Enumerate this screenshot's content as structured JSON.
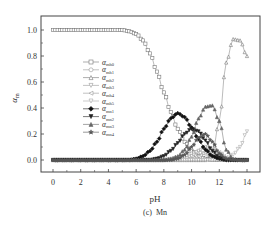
{
  "chart_data": {
    "type": "line",
    "title": "",
    "caption": "(c)  Mn",
    "xlabel": "pH",
    "ylabel": "α_m",
    "ylabel_main": "α",
    "ylabel_sub": "m",
    "xlim": [
      -1,
      15
    ],
    "ylim": [
      -0.1,
      1.15
    ],
    "xticks": [
      0,
      2,
      4,
      6,
      8,
      10,
      12,
      14
    ],
    "yticks": [
      0.0,
      0.2,
      0.4,
      0.6,
      0.8,
      1.0
    ],
    "xtick_labels": [
      "0",
      "2",
      "4",
      "6",
      "8",
      "10",
      "12",
      "14"
    ],
    "ytick_labels": [
      "0.0",
      "0.2",
      "0.4",
      "0.6",
      "0.8",
      "1.0"
    ],
    "grid": false,
    "legend_position": "inside-left-center",
    "legend": [
      {
        "name": "α_mh0",
        "main": "α",
        "sub": "mh0",
        "marker": "square-open",
        "color": "#777777"
      },
      {
        "name": "α_mh1",
        "main": "α",
        "sub": "mh1",
        "marker": "circle-open",
        "color": "#999999"
      },
      {
        "name": "α_mh2",
        "main": "α",
        "sub": "mh2",
        "marker": "triangle-up-open",
        "color": "#777777"
      },
      {
        "name": "α_mh3",
        "main": "α",
        "sub": "mh3",
        "marker": "triangle-down-open",
        "color": "#999999"
      },
      {
        "name": "α_mh4",
        "main": "α",
        "sub": "mh4",
        "marker": "triangle-left-open",
        "color": "#999999"
      },
      {
        "name": "α_mh5",
        "main": "α",
        "sub": "mh5",
        "marker": "triangle-down-open",
        "color": "#aaaaaa"
      },
      {
        "name": "α_mn1",
        "main": "α",
        "sub": "mn1",
        "marker": "diamond-filled",
        "color": "#111111"
      },
      {
        "name": "α_mn2",
        "main": "α",
        "sub": "mn2",
        "marker": "triangle-down-filled",
        "color": "#222222"
      },
      {
        "name": "α_mn3",
        "main": "α",
        "sub": "mn3",
        "marker": "triangle-up-filled",
        "color": "#666666"
      },
      {
        "name": "α_mn4",
        "main": "α",
        "sub": "mn4",
        "marker": "star-filled",
        "color": "#555555"
      }
    ],
    "x": [
      0,
      0.5,
      1,
      1.5,
      2,
      2.5,
      3,
      3.5,
      4,
      4.5,
      5,
      5.5,
      6,
      6.5,
      7,
      7.5,
      8,
      8.5,
      9,
      9.5,
      10,
      10.5,
      11,
      11.5,
      12,
      12.5,
      13,
      13.5,
      14
    ],
    "series": [
      {
        "name": "α_mh0",
        "values": [
          1,
          1,
          1,
          1,
          1,
          1,
          1,
          1,
          1,
          1,
          1,
          0.99,
          0.97,
          0.92,
          0.82,
          0.68,
          0.52,
          0.37,
          0.24,
          0.14,
          0.07,
          0.03,
          0.01,
          0,
          0,
          0,
          0,
          0,
          0
        ]
      },
      {
        "name": "α_mh1",
        "values": [
          0,
          0,
          0,
          0,
          0,
          0,
          0,
          0,
          0,
          0,
          0,
          0,
          0,
          0,
          0,
          0,
          0,
          0.01,
          0.02,
          0.03,
          0.05,
          0.06,
          0.05,
          0.03,
          0.01,
          0,
          0,
          0,
          0
        ]
      },
      {
        "name": "α_mh2",
        "values": [
          0,
          0,
          0,
          0,
          0,
          0,
          0,
          0,
          0,
          0,
          0,
          0,
          0,
          0,
          0,
          0,
          0,
          0,
          0,
          0,
          0,
          0,
          0,
          0.05,
          0.3,
          0.75,
          0.93,
          0.92,
          0.8
        ]
      },
      {
        "name": "α_mh3",
        "values": [
          0,
          0,
          0,
          0,
          0,
          0,
          0,
          0,
          0,
          0,
          0,
          0,
          0,
          0,
          0,
          0,
          0,
          0,
          0,
          0.01,
          0.03,
          0.07,
          0.1,
          0.08,
          0.03,
          0.01,
          0,
          0,
          0
        ]
      },
      {
        "name": "α_mh4",
        "values": [
          0,
          0,
          0,
          0,
          0,
          0,
          0,
          0,
          0,
          0,
          0,
          0,
          0,
          0,
          0,
          0,
          0,
          0,
          0,
          0,
          0.01,
          0.03,
          0.06,
          0.08,
          0.06,
          0.02,
          0,
          0,
          0
        ]
      },
      {
        "name": "α_mh5",
        "values": [
          0,
          0,
          0,
          0,
          0,
          0,
          0,
          0,
          0,
          0,
          0,
          0,
          0,
          0,
          0,
          0,
          0,
          0,
          0,
          0,
          0,
          0,
          0,
          0,
          0,
          0.01,
          0.04,
          0.1,
          0.22
        ]
      },
      {
        "name": "α_mn1",
        "values": [
          0,
          0,
          0,
          0,
          0,
          0,
          0,
          0,
          0,
          0,
          0,
          0,
          0.01,
          0.03,
          0.07,
          0.14,
          0.24,
          0.32,
          0.36,
          0.33,
          0.25,
          0.16,
          0.08,
          0.03,
          0.01,
          0,
          0,
          0,
          0
        ]
      },
      {
        "name": "α_mn2",
        "values": [
          0,
          0,
          0,
          0,
          0,
          0,
          0,
          0,
          0,
          0,
          0,
          0,
          0,
          0,
          0,
          0.01,
          0.03,
          0.07,
          0.13,
          0.2,
          0.24,
          0.22,
          0.15,
          0.07,
          0.02,
          0,
          0,
          0,
          0
        ]
      },
      {
        "name": "α_mn3",
        "values": [
          0,
          0,
          0,
          0,
          0,
          0,
          0,
          0,
          0,
          0,
          0,
          0,
          0,
          0,
          0,
          0,
          0,
          0.01,
          0.03,
          0.08,
          0.18,
          0.32,
          0.41,
          0.42,
          0.3,
          0.08,
          0.01,
          0,
          0
        ]
      },
      {
        "name": "α_mn4",
        "values": [
          0,
          0,
          0,
          0,
          0,
          0,
          0,
          0,
          0,
          0,
          0,
          0,
          0,
          0,
          0,
          0,
          0,
          0,
          0.01,
          0.04,
          0.1,
          0.17,
          0.2,
          0.14,
          0.05,
          0.01,
          0,
          0,
          0
        ]
      }
    ]
  }
}
